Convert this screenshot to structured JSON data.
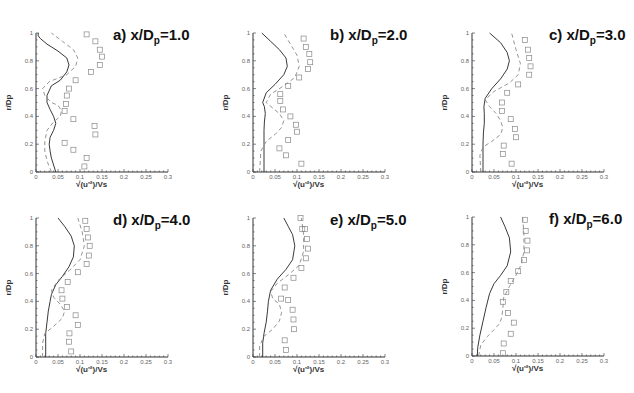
{
  "figure": {
    "x_label": "√(u'²)/Vs",
    "y_label": "r/Dp",
    "x_ticks": [
      "0",
      "0.05",
      "0.1",
      "0.15",
      "0.2",
      "0.25",
      "0.3"
    ],
    "y_ticks": [
      "0",
      "0.2",
      "0.4",
      "0.6",
      "0.8",
      "1"
    ]
  },
  "chart_data": [
    {
      "type": "line",
      "title": "a) x/Dp=1.0",
      "xlabel": "√(u'²)/Vs",
      "ylabel": "r/Dp",
      "xlim": [
        0,
        0.3
      ],
      "ylim": [
        0,
        1
      ],
      "grid": false,
      "series": [
        {
          "name": "solid",
          "style": "solid",
          "x": [
            0.045,
            0.04,
            0.035,
            0.032,
            0.03,
            0.032,
            0.04,
            0.045,
            0.04,
            0.032,
            0.025,
            0.025,
            0.035,
            0.055,
            0.07,
            0.075,
            0.07,
            0.05,
            0.025,
            0.01,
            0.005,
            0.005
          ],
          "y": [
            0.0,
            0.05,
            0.1,
            0.15,
            0.2,
            0.25,
            0.3,
            0.35,
            0.4,
            0.45,
            0.5,
            0.55,
            0.62,
            0.66,
            0.72,
            0.77,
            0.82,
            0.87,
            0.92,
            0.96,
            0.98,
            1.0
          ]
        },
        {
          "name": "dashed",
          "style": "dashed",
          "x": [
            0.035,
            0.025,
            0.02,
            0.02,
            0.025,
            0.04,
            0.055,
            0.058,
            0.05,
            0.035,
            0.02,
            0.015,
            0.03,
            0.07,
            0.09,
            0.095,
            0.085,
            0.06,
            0.035
          ],
          "y": [
            0.0,
            0.08,
            0.15,
            0.22,
            0.3,
            0.36,
            0.4,
            0.44,
            0.48,
            0.5,
            0.55,
            0.6,
            0.65,
            0.7,
            0.76,
            0.82,
            0.88,
            0.94,
            1.0
          ]
        },
        {
          "name": "experiment",
          "style": "square-markers",
          "x": [
            0.11,
            0.115,
            0.085,
            0.065,
            0.135,
            0.133,
            0.085,
            0.065,
            0.068,
            0.07,
            0.075,
            0.09,
            0.125,
            0.145,
            0.15,
            0.145,
            0.135,
            0.115
          ],
          "y": [
            0.04,
            0.1,
            0.16,
            0.21,
            0.27,
            0.33,
            0.38,
            0.44,
            0.49,
            0.55,
            0.6,
            0.66,
            0.72,
            0.77,
            0.83,
            0.88,
            0.94,
            0.99
          ]
        }
      ]
    },
    {
      "type": "line",
      "title": "b) x/Dp=2.0",
      "xlabel": "√(u'²)/Vs",
      "ylabel": "r/Dp",
      "xlim": [
        0,
        0.3
      ],
      "ylim": [
        0,
        1
      ],
      "grid": false,
      "series": [
        {
          "name": "solid",
          "style": "solid",
          "x": [
            0.025,
            0.025,
            0.025,
            0.025,
            0.026,
            0.028,
            0.026,
            0.022,
            0.03,
            0.05,
            0.07,
            0.078,
            0.075,
            0.06,
            0.04,
            0.02
          ],
          "y": [
            0.0,
            0.1,
            0.2,
            0.3,
            0.36,
            0.42,
            0.47,
            0.5,
            0.57,
            0.63,
            0.7,
            0.76,
            0.82,
            0.88,
            0.94,
            1.0
          ]
        },
        {
          "name": "dashed",
          "style": "dashed",
          "x": [
            0.015,
            0.018,
            0.03,
            0.05,
            0.065,
            0.07,
            0.06,
            0.045,
            0.03,
            0.04,
            0.07,
            0.095,
            0.105,
            0.1,
            0.085,
            0.07
          ],
          "y": [
            0.0,
            0.15,
            0.22,
            0.27,
            0.32,
            0.37,
            0.42,
            0.46,
            0.5,
            0.56,
            0.62,
            0.68,
            0.76,
            0.84,
            0.92,
            1.0
          ]
        },
        {
          "name": "experiment",
          "style": "square-markers",
          "x": [
            0.11,
            0.075,
            0.06,
            0.08,
            0.1,
            0.098,
            0.085,
            0.068,
            0.062,
            0.062,
            0.08,
            0.105,
            0.125,
            0.13,
            0.128,
            0.12,
            0.115
          ],
          "y": [
            0.06,
            0.12,
            0.17,
            0.23,
            0.29,
            0.34,
            0.4,
            0.45,
            0.51,
            0.56,
            0.62,
            0.68,
            0.74,
            0.79,
            0.85,
            0.9,
            0.96
          ]
        }
      ]
    },
    {
      "type": "line",
      "title": "c) x/Dp=3.0",
      "xlabel": "√(u'²)/Vs",
      "ylabel": "r/Dp",
      "xlim": [
        0,
        0.3
      ],
      "ylim": [
        0,
        1
      ],
      "grid": false,
      "series": [
        {
          "name": "solid",
          "style": "solid",
          "x": [
            0.025,
            0.025,
            0.025,
            0.026,
            0.028,
            0.028,
            0.027,
            0.03,
            0.045,
            0.065,
            0.08,
            0.085,
            0.08,
            0.065,
            0.04
          ],
          "y": [
            0.0,
            0.1,
            0.2,
            0.28,
            0.35,
            0.42,
            0.47,
            0.53,
            0.6,
            0.67,
            0.74,
            0.8,
            0.86,
            0.93,
            1.0
          ]
        },
        {
          "name": "dashed",
          "style": "dashed",
          "x": [
            0.02,
            0.018,
            0.025,
            0.045,
            0.065,
            0.07,
            0.065,
            0.055,
            0.04,
            0.03,
            0.05,
            0.085,
            0.105,
            0.11,
            0.1,
            0.09
          ],
          "y": [
            0.0,
            0.12,
            0.18,
            0.22,
            0.27,
            0.32,
            0.37,
            0.42,
            0.47,
            0.52,
            0.58,
            0.64,
            0.7,
            0.78,
            0.88,
            1.0
          ]
        },
        {
          "name": "experiment",
          "style": "square-markers",
          "x": [
            0.09,
            0.07,
            0.072,
            0.1,
            0.098,
            0.088,
            0.068,
            0.068,
            0.08,
            0.105,
            0.13,
            0.133,
            0.13,
            0.127,
            0.12
          ],
          "y": [
            0.06,
            0.13,
            0.19,
            0.25,
            0.31,
            0.38,
            0.44,
            0.5,
            0.57,
            0.63,
            0.7,
            0.76,
            0.82,
            0.88,
            0.95
          ]
        }
      ]
    },
    {
      "type": "line",
      "title": "d) x/Dp=4.0",
      "xlabel": "√(u'²)/Vs",
      "ylabel": "r/Dp",
      "xlim": [
        0,
        0.3
      ],
      "ylim": [
        0,
        1
      ],
      "grid": false,
      "series": [
        {
          "name": "solid",
          "style": "solid",
          "x": [
            0.022,
            0.022,
            0.022,
            0.025,
            0.028,
            0.032,
            0.035,
            0.045,
            0.06,
            0.075,
            0.085,
            0.087,
            0.08,
            0.065,
            0.05
          ],
          "y": [
            0.0,
            0.1,
            0.17,
            0.25,
            0.33,
            0.4,
            0.45,
            0.52,
            0.58,
            0.65,
            0.72,
            0.8,
            0.87,
            0.94,
            1.0
          ]
        },
        {
          "name": "dashed",
          "style": "dashed",
          "x": [
            0.015,
            0.015,
            0.02,
            0.04,
            0.06,
            0.065,
            0.055,
            0.04,
            0.035,
            0.05,
            0.075,
            0.1,
            0.11,
            0.105,
            0.095
          ],
          "y": [
            0.0,
            0.1,
            0.17,
            0.22,
            0.28,
            0.33,
            0.38,
            0.43,
            0.48,
            0.55,
            0.62,
            0.7,
            0.8,
            0.9,
            1.0
          ]
        },
        {
          "name": "experiment",
          "style": "square-markers",
          "x": [
            0.08,
            0.075,
            0.076,
            0.095,
            0.09,
            0.07,
            0.06,
            0.058,
            0.072,
            0.095,
            0.115,
            0.12,
            0.122,
            0.118,
            0.115,
            0.112
          ],
          "y": [
            0.04,
            0.11,
            0.17,
            0.23,
            0.3,
            0.36,
            0.42,
            0.48,
            0.54,
            0.61,
            0.67,
            0.73,
            0.8,
            0.86,
            0.92,
            0.98
          ]
        }
      ]
    },
    {
      "type": "line",
      "title": "e) x/Dp=5.0",
      "xlabel": "√(u'²)/Vs",
      "ylabel": "r/Dp",
      "xlim": [
        0,
        0.3
      ],
      "ylim": [
        0,
        1
      ],
      "grid": false,
      "series": [
        {
          "name": "solid",
          "style": "solid",
          "x": [
            0.022,
            0.022,
            0.025,
            0.03,
            0.033,
            0.035,
            0.04,
            0.055,
            0.075,
            0.09,
            0.095,
            0.09,
            0.08,
            0.07
          ],
          "y": [
            0.0,
            0.1,
            0.17,
            0.25,
            0.33,
            0.4,
            0.48,
            0.56,
            0.63,
            0.7,
            0.8,
            0.88,
            0.94,
            1.0
          ]
        },
        {
          "name": "dashed",
          "style": "dashed",
          "x": [
            0.015,
            0.015,
            0.025,
            0.045,
            0.06,
            0.065,
            0.06,
            0.045,
            0.04,
            0.055,
            0.08,
            0.105,
            0.115,
            0.115,
            0.11
          ],
          "y": [
            0.0,
            0.08,
            0.15,
            0.2,
            0.26,
            0.32,
            0.38,
            0.42,
            0.47,
            0.53,
            0.59,
            0.66,
            0.76,
            0.88,
            1.0
          ]
        },
        {
          "name": "experiment",
          "style": "square-markers",
          "x": [
            0.075,
            0.072,
            0.093,
            0.092,
            0.09,
            0.08,
            0.064,
            0.072,
            0.092,
            0.11,
            0.12,
            0.125,
            0.123,
            0.118,
            0.112,
            0.108
          ],
          "y": [
            0.05,
            0.12,
            0.2,
            0.27,
            0.34,
            0.41,
            0.42,
            0.5,
            0.57,
            0.64,
            0.71,
            0.78,
            0.85,
            0.92,
            0.92,
            1.0
          ]
        }
      ]
    },
    {
      "type": "line",
      "title": "f) x/Dp=6.0",
      "xlabel": "√(u'²)/Vs",
      "ylabel": "r/Dp",
      "xlim": [
        0,
        0.3
      ],
      "ylim": [
        0,
        1
      ],
      "grid": false,
      "series": [
        {
          "name": "solid",
          "style": "solid",
          "x": [
            0.012,
            0.013,
            0.018,
            0.025,
            0.032,
            0.04,
            0.05,
            0.065,
            0.08,
            0.088,
            0.085,
            0.075,
            0.065
          ],
          "y": [
            0.0,
            0.06,
            0.15,
            0.25,
            0.35,
            0.45,
            0.52,
            0.58,
            0.65,
            0.75,
            0.85,
            0.93,
            1.0
          ]
        },
        {
          "name": "dashed",
          "style": "dashed",
          "x": [
            0.015,
            0.02,
            0.035,
            0.05,
            0.062,
            0.068,
            0.07,
            0.072,
            0.085,
            0.1,
            0.112,
            0.118,
            0.118,
            0.115
          ],
          "y": [
            0.0,
            0.08,
            0.14,
            0.19,
            0.23,
            0.28,
            0.34,
            0.42,
            0.5,
            0.58,
            0.66,
            0.75,
            0.88,
            1.0
          ]
        },
        {
          "name": "experiment",
          "style": "square-markers",
          "x": [
            0.07,
            0.072,
            0.088,
            0.095,
            0.082,
            0.07,
            0.078,
            0.088,
            0.105,
            0.118,
            0.125,
            0.126,
            0.122,
            0.12
          ],
          "y": [
            0.02,
            0.09,
            0.16,
            0.24,
            0.31,
            0.39,
            0.46,
            0.54,
            0.61,
            0.69,
            0.76,
            0.83,
            0.9,
            0.98
          ]
        }
      ]
    }
  ],
  "panels": [
    {
      "label_prefix": "a) x/D",
      "label_sub": "p",
      "label_suffix": "=1.0"
    },
    {
      "label_prefix": "b) x/D",
      "label_sub": "p",
      "label_suffix": "=2.0"
    },
    {
      "label_prefix": "c) x/D",
      "label_sub": "p",
      "label_suffix": "=3.0"
    },
    {
      "label_prefix": "d) x/D",
      "label_sub": "p",
      "label_suffix": "=4.0"
    },
    {
      "label_prefix": "e) x/D",
      "label_sub": "p",
      "label_suffix": "=5.0"
    },
    {
      "label_prefix": "f) x/D",
      "label_sub": "p",
      "label_suffix": "=6.0"
    }
  ],
  "colors": {
    "solid": "#222222",
    "dashed": "#888888",
    "markers": "#888888",
    "axis": "#333333"
  }
}
